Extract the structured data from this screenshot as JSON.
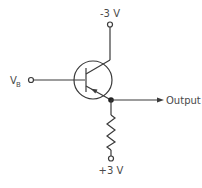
{
  "diagram": {
    "type": "circuit-schematic",
    "title": "",
    "labels": {
      "input": "V",
      "input_subscript": "B",
      "collector_supply": "-3 V",
      "emitter_supply": "+3 V",
      "output": "Output"
    },
    "components": [
      {
        "id": "Q1",
        "kind": "transistor-bjt",
        "polarity": "PNP",
        "terminals": [
          "base",
          "collector",
          "emitter"
        ]
      },
      {
        "id": "R1",
        "kind": "resistor",
        "between": [
          "emitter-node",
          "+3 V"
        ]
      }
    ],
    "nodes": [
      {
        "id": "input",
        "label": "V_B",
        "connects": [
          "Q1.base"
        ]
      },
      {
        "id": "collector-supply",
        "label": "-3 V",
        "connects": [
          "Q1.collector"
        ]
      },
      {
        "id": "emitter-node",
        "label": "Output",
        "connects": [
          "Q1.emitter",
          "R1",
          "output"
        ]
      },
      {
        "id": "emitter-supply",
        "label": "+3 V",
        "connects": [
          "R1"
        ]
      }
    ],
    "colors": {
      "line": "#3a3a3a",
      "text": "#4a4a4a",
      "background": "#ffffff"
    }
  }
}
